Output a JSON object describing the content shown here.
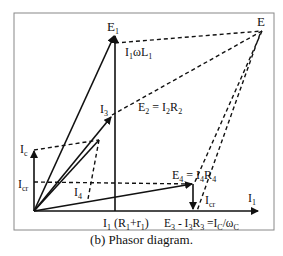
{
  "caption": "(b) Phasor diagram.",
  "labels": {
    "E1": "E",
    "E1_sub": "1",
    "I1wL1": "I",
    "I1wL1_sub1": "1",
    "I1wL1_mid": "ωL",
    "I1wL1_sub2": "1",
    "E": "E",
    "I3": "I",
    "I3_sub": "3",
    "E2_eq": "E",
    "E2_sub": "2",
    "E2_rest": " = I",
    "E2_sub2": "2",
    "E2_R": "R",
    "E2_sub3": "2",
    "Ic": "I",
    "Ic_sub": "c",
    "Icr": "I",
    "Icr_sub": "cr",
    "I4": "I",
    "I4_sub": "4",
    "E4_eq": "E",
    "E4_sub": "4",
    "E4_rest": " = I",
    "E4_sub2": "4",
    "E4_R": "R",
    "E4_sub3": "4",
    "Icr2": "I",
    "Icr2_sub": "cr",
    "I1": "I",
    "I1_sub": "1",
    "I1R": "I",
    "I1R_sub": "1",
    "I1R_rest": " (R",
    "I1R_sub2": "1",
    "I1R_plus": "+r",
    "I1R_sub3": "1",
    "I1R_close": ")",
    "E3": "E",
    "E3_sub": "3",
    "E3_rest": " - I",
    "E3_sub2": "3",
    "E3_R": "R",
    "E3_sub3": "3",
    "E3_eq": " =I",
    "E3_sub4": "C",
    "E3_w": "/ω",
    "E3_sub5": "C"
  },
  "colors": {
    "line": "#111111",
    "frame": "#888888"
  }
}
